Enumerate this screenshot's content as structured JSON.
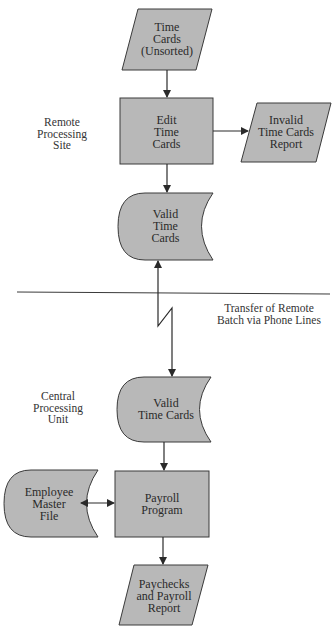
{
  "diagram": {
    "type": "system-flowchart",
    "colors": {
      "shape_fill": "#b8b8b8",
      "stroke": "#3a3a3a",
      "text": "#2a2a2a",
      "background": "#ffffff"
    },
    "sections": [
      {
        "id": "remote",
        "label_lines": [
          "Remote",
          "Processing",
          "Site"
        ]
      },
      {
        "id": "central",
        "label_lines": [
          "Central",
          "Processing",
          "Unit"
        ]
      }
    ],
    "transfer_label_lines": [
      "Transfer of Remote",
      "Batch via Phone Lines"
    ],
    "nodes": [
      {
        "id": "time-cards-unsorted",
        "shape": "parallelogram",
        "kind": "input/output",
        "lines": [
          "Time",
          "Cards",
          "(Unsorted)"
        ]
      },
      {
        "id": "edit-time-cards",
        "shape": "rectangle",
        "kind": "process",
        "lines": [
          "Edit",
          "Time",
          "Cards"
        ]
      },
      {
        "id": "invalid-time-cards-report",
        "shape": "parallelogram",
        "kind": "input/output",
        "lines": [
          "Invalid",
          "Time Cards",
          "Report"
        ]
      },
      {
        "id": "valid-time-cards-remote",
        "shape": "online-storage",
        "kind": "storage",
        "lines": [
          "Valid",
          "Time",
          "Cards"
        ]
      },
      {
        "id": "valid-time-cards-central",
        "shape": "online-storage",
        "kind": "storage",
        "lines": [
          "Valid",
          "Time Cards"
        ]
      },
      {
        "id": "employee-master-file",
        "shape": "online-storage",
        "kind": "storage",
        "lines": [
          "Employee",
          "Master",
          "File"
        ]
      },
      {
        "id": "payroll-program",
        "shape": "rectangle",
        "kind": "process",
        "lines": [
          "Payroll",
          "Program"
        ]
      },
      {
        "id": "paychecks-payroll-report",
        "shape": "parallelogram",
        "kind": "input/output",
        "lines": [
          "Paychecks",
          "and Payroll",
          "Report"
        ]
      }
    ],
    "edges": [
      {
        "from": "time-cards-unsorted",
        "to": "edit-time-cards",
        "direction": "forward"
      },
      {
        "from": "edit-time-cards",
        "to": "invalid-time-cards-report",
        "direction": "forward"
      },
      {
        "from": "edit-time-cards",
        "to": "valid-time-cards-remote",
        "direction": "forward"
      },
      {
        "from": "valid-time-cards-remote",
        "to": "valid-time-cards-central",
        "direction": "both",
        "style": "communication-link"
      },
      {
        "from": "valid-time-cards-central",
        "to": "payroll-program",
        "direction": "forward"
      },
      {
        "from": "employee-master-file",
        "to": "payroll-program",
        "direction": "both"
      },
      {
        "from": "payroll-program",
        "to": "paychecks-payroll-report",
        "direction": "forward"
      }
    ]
  }
}
